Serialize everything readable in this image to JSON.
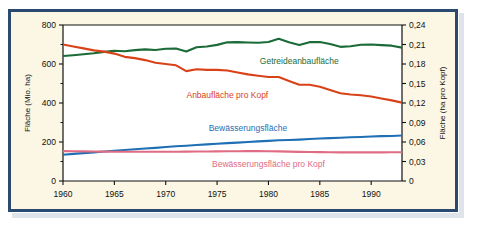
{
  "figure": {
    "background_color": "#fbf7e4",
    "frame_color": "#2b4a6f",
    "page_background": "#ffffff"
  },
  "chart_data": {
    "type": "line",
    "title": "",
    "xlabel": "",
    "ylabel": "Fläche (Mio. ha)",
    "y2label": "Fläche (ha pro Kopf)",
    "grid": false,
    "legend_position": "inline-annotations",
    "xlim": [
      1960,
      1993
    ],
    "ylim": [
      0,
      800
    ],
    "y2lim": [
      0,
      0.24
    ],
    "xticks": [
      1960,
      1965,
      1970,
      1975,
      1980,
      1985,
      1990
    ],
    "xtick_labels": [
      "1960",
      "1965",
      "1970",
      "1975",
      "1980",
      "1985",
      "1990"
    ],
    "yticks": [
      0,
      200,
      400,
      600,
      800
    ],
    "ytick_labels": [
      "0",
      "200",
      "400",
      "600",
      "800"
    ],
    "y2ticks": [
      0,
      0.03,
      0.06,
      0.09,
      0.12,
      0.15,
      0.18,
      0.21,
      0.24
    ],
    "y2tick_labels": [
      "0",
      "0,03",
      "0,06",
      "0,09",
      "0,12",
      "0,15",
      "0,18",
      "0,21",
      "0,24"
    ],
    "x": [
      1960,
      1961,
      1962,
      1963,
      1964,
      1965,
      1966,
      1967,
      1968,
      1969,
      1970,
      1971,
      1972,
      1973,
      1974,
      1975,
      1976,
      1977,
      1978,
      1979,
      1980,
      1981,
      1982,
      1983,
      1984,
      1985,
      1986,
      1987,
      1988,
      1989,
      1990,
      1991,
      1992,
      1993
    ],
    "series": [
      {
        "name": "Getreideanbaufläche",
        "axis": "left",
        "units": "Mio. ha",
        "color": "#1a6b38",
        "label_x": 1983,
        "label_y": 600,
        "values": [
          641,
          645,
          650,
          655,
          662,
          668,
          665,
          671,
          675,
          672,
          678,
          679,
          664,
          686,
          690,
          698,
          711,
          712,
          710,
          709,
          713,
          729,
          711,
          697,
          712,
          713,
          703,
          688,
          691,
          699,
          700,
          697,
          694,
          684
        ]
      },
      {
        "name": "Anbaufläche pro Kopf",
        "axis": "right",
        "units": "ha pro Kopf",
        "color": "#d94218",
        "label_x": 1976,
        "label_y": 0.128,
        "values": [
          0.21,
          0.207,
          0.204,
          0.201,
          0.199,
          0.196,
          0.191,
          0.189,
          0.186,
          0.182,
          0.18,
          0.178,
          0.169,
          0.172,
          0.171,
          0.171,
          0.17,
          0.167,
          0.164,
          0.162,
          0.16,
          0.16,
          0.154,
          0.148,
          0.148,
          0.145,
          0.14,
          0.135,
          0.133,
          0.132,
          0.13,
          0.127,
          0.124,
          0.1205
        ]
      },
      {
        "name": "Bewässerungsfläche",
        "axis": "left",
        "units": "Mio. ha",
        "color": "#1f6fb5",
        "label_x": 1978,
        "label_y": 255,
        "values": [
          135,
          139,
          143,
          147,
          151,
          155,
          159,
          163,
          167,
          170,
          174,
          178,
          181,
          185,
          188,
          191,
          194,
          197,
          200,
          203,
          206,
          209,
          210,
          212,
          215,
          218,
          220,
          222,
          224,
          226,
          228,
          230,
          231,
          233
        ]
      },
      {
        "name": "Bewässerungsfläche pro Kopf",
        "axis": "right",
        "units": "ha pro Kopf",
        "color": "#e06c84",
        "label_x": 1980,
        "label_y": 0.021,
        "values": [
          0.046,
          0.0458,
          0.0456,
          0.0454,
          0.0452,
          0.045,
          0.0449,
          0.045,
          0.045,
          0.045,
          0.045,
          0.0451,
          0.0452,
          0.0453,
          0.0454,
          0.0456,
          0.0457,
          0.0458,
          0.0459,
          0.046,
          0.0458,
          0.0456,
          0.0452,
          0.0448,
          0.0446,
          0.0444,
          0.0442,
          0.0441,
          0.044,
          0.044,
          0.044,
          0.0441,
          0.0442,
          0.0442
        ]
      }
    ]
  }
}
